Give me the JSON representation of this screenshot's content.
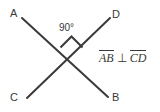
{
  "diagram": {
    "type": "geometry-intersecting-lines",
    "background_color": "#ffffff",
    "stroke_color": "#3a3a3a",
    "stroke_width": 2,
    "points": [
      {
        "name": "A",
        "label": "A",
        "x": 22,
        "y": 18
      },
      {
        "name": "D",
        "label": "D",
        "x": 110,
        "y": 18
      },
      {
        "name": "C",
        "label": "C",
        "x": 27,
        "y": 98
      },
      {
        "name": "B",
        "label": "B",
        "x": 108,
        "y": 97
      }
    ],
    "intersection": {
      "x": 70,
      "y": 57
    },
    "lines": [
      {
        "name": "line-AB",
        "from": "A",
        "to": "B",
        "x1": 22,
        "y1": 18,
        "x2": 108,
        "y2": 97
      },
      {
        "name": "line-CD",
        "from": "C",
        "to": "D",
        "x1": 27,
        "y1": 98,
        "x2": 110,
        "y2": 18
      }
    ],
    "angle_marker": {
      "label": "90°",
      "shape": "square",
      "position": "above-intersection"
    },
    "relation": {
      "first_segment": "AB",
      "symbol": "⊥",
      "second_segment": "CD",
      "full_text": "AB ⊥ CD"
    }
  }
}
